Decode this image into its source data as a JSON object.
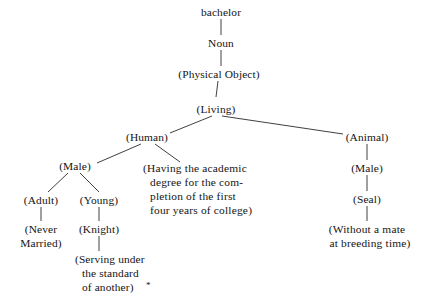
{
  "diagram": {
    "type": "semantic-feature-tree",
    "headword": "bachelor",
    "footnote_marker": "*",
    "nodes": {
      "root": "bachelor",
      "pos": "Noun",
      "physical_object": "(Physical Object)",
      "living": "(Living)",
      "human": "(Human)",
      "animal": "(Animal)",
      "human_male": "(Male)",
      "animal_male": "(Male)",
      "adult": "(Adult)",
      "young": "(Young)",
      "seal": "(Seal)",
      "never_married_line1": "(Never",
      "never_married_line2": "Married)",
      "knight": "(Knight)",
      "serving_line1": "(Serving under",
      "serving_line2": "the standard",
      "serving_line3": "of another)",
      "degree_line1": "(Having the academic",
      "degree_line2": "degree for the com-",
      "degree_line3": "pletion of the first",
      "degree_line4": "four years of college)",
      "without_mate_line1": "(Without a mate",
      "without_mate_line2": "at breeding time)"
    },
    "colors": {
      "text": "#141414",
      "edge": "#2a2a2a",
      "background": "#ffffff"
    }
  }
}
